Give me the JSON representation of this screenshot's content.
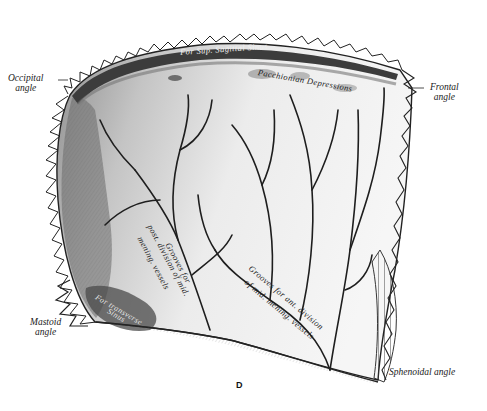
{
  "figure": {
    "plate_letter": "D",
    "caption": "",
    "colors": {
      "ink": "#1a1a1a",
      "bone_light": "#e8e8e8",
      "bone_mid": "#b9b9b9",
      "bone_dark": "#5a5a5a",
      "background": "#ffffff"
    }
  },
  "labels": {
    "occipital_angle": [
      "Occipital",
      "angle"
    ],
    "frontal_angle": [
      "Frontal",
      "angle"
    ],
    "mastoid_angle": [
      "Mastoid",
      "angle"
    ],
    "sphenoidal_angle": "Sphenoidal angle"
  },
  "inner_labels": {
    "sup_sagittal_sinus": "For Sup. Sagittal  Sinus",
    "pacchionian": "Pacchionian Depressions",
    "post_grooves": [
      "Grooves for",
      "post. division of mid.",
      "mening. vessels"
    ],
    "ant_grooves": [
      "Grooves for ant. division",
      "of mid. mening. vessels"
    ],
    "transverse_sinus": [
      "For transverse",
      "Sinus"
    ]
  }
}
